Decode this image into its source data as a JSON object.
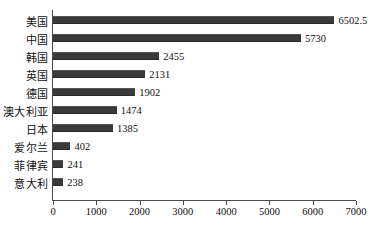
{
  "chart_data": {
    "type": "bar",
    "orientation": "horizontal",
    "title": "",
    "xlabel": "",
    "ylabel": "",
    "xlim": [
      0,
      7000
    ],
    "xticks": [
      0,
      1000,
      2000,
      3000,
      4000,
      5000,
      6000,
      7000
    ],
    "xtick_labels": [
      "0",
      "1000",
      "2000",
      "3000",
      "4000",
      "5000",
      "6000",
      "7000"
    ],
    "grid": false,
    "legend": null,
    "categories": [
      "美国",
      "中国",
      "韩国",
      "英国",
      "德国",
      "澳大利亚",
      "日本",
      "爱尔兰",
      "菲律宾",
      "意大利"
    ],
    "values": [
      6502.5,
      5730,
      2455,
      2131,
      1902,
      1474,
      1385,
      402,
      241,
      238
    ],
    "value_labels": [
      "6502.5",
      "5730",
      "2455",
      "2131",
      "1902",
      "1474",
      "1385",
      "402",
      "241",
      "238"
    ],
    "bar_color": "#3a3a3a",
    "axis_color": "#4a4a4a",
    "background": "#ffffff"
  }
}
